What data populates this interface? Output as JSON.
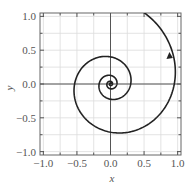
{
  "chart_data": {
    "type": "line",
    "title": "",
    "xlabel": "x",
    "ylabel": "y",
    "xlim": [
      -1.05,
      1.05
    ],
    "ylim": [
      -1.05,
      1.05
    ],
    "xticks": [
      -1.0,
      -0.5,
      0.0,
      0.5,
      1.0
    ],
    "yticks": [
      -1.0,
      -0.5,
      0.0,
      0.5,
      1.0
    ],
    "xtick_labels": [
      "−1.0",
      "−0.5",
      "0.0",
      "0.5",
      "1.0"
    ],
    "ytick_labels": [
      "−1.0",
      "−0.5",
      "0.0",
      "0.5",
      "1.0"
    ],
    "minor_grid_step": 0.25,
    "grid": true,
    "legend": null,
    "series": [
      {
        "name": "logarithmic spiral trajectory",
        "description": "Counterclockwise outward spiral from origin, r = 0.95 * exp(0.183 * theta)",
        "parametric": {
          "r0": 0.95,
          "growth_per_radian": 0.183,
          "theta_start": -25.0,
          "theta_end": 1.4
        },
        "approx_points": [
          {
            "x": 0.95,
            "y": 0.0
          },
          {
            "x": 0.0,
            "y": -0.72
          },
          {
            "x": -0.53,
            "y": 0.0
          },
          {
            "x": 0.0,
            "y": 0.39
          },
          {
            "x": 0.29,
            "y": 0.0
          },
          {
            "x": 0.0,
            "y": -0.22
          },
          {
            "x": -0.16,
            "y": 0.0
          },
          {
            "x": 0.0,
            "y": 0.0
          }
        ],
        "color": "#222222",
        "arrow": {
          "x": 0.9,
          "y": 0.4,
          "direction": "up"
        }
      }
    ]
  },
  "axes": {
    "x_label": "x",
    "y_label": "y"
  }
}
